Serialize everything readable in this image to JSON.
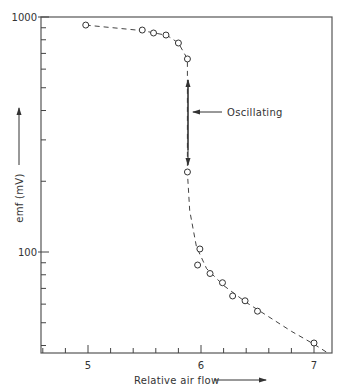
{
  "chart_data": {
    "type": "scatter",
    "title": "",
    "xlabel": "Relative air flow",
    "ylabel": "emf (mV)",
    "x_scale": "linear",
    "y_scale": "log",
    "xlim": [
      4.58,
      7.13
    ],
    "ylim": [
      35,
      1000
    ],
    "x_ticks": [
      5,
      6,
      7
    ],
    "x_tick_labels": [
      "5",
      "6",
      "7"
    ],
    "x_minor_step": 0.2,
    "y_ticks": [
      100,
      1000
    ],
    "y_tick_labels": [
      "100",
      "1000"
    ],
    "y_minor_ticks": [
      40,
      50,
      60,
      70,
      80,
      90,
      200,
      300,
      400,
      500,
      600,
      700,
      800,
      900
    ],
    "grid": false,
    "legend": null,
    "series": [
      {
        "name": "emf vs relative air flow",
        "marker": "open-circle",
        "line": "dashed",
        "points": [
          {
            "x": 4.98,
            "y": 924
          },
          {
            "x": 5.48,
            "y": 880
          },
          {
            "x": 5.58,
            "y": 855
          },
          {
            "x": 5.69,
            "y": 838
          },
          {
            "x": 5.8,
            "y": 775
          },
          {
            "x": 5.88,
            "y": 663
          },
          {
            "x": 5.88,
            "y": 219
          },
          {
            "x": 5.99,
            "y": 103
          },
          {
            "x": 5.97,
            "y": 88
          },
          {
            "x": 6.08,
            "y": 81
          },
          {
            "x": 6.19,
            "y": 74
          },
          {
            "x": 6.28,
            "y": 65
          },
          {
            "x": 6.39,
            "y": 62
          },
          {
            "x": 6.5,
            "y": 56
          },
          {
            "x": 7.0,
            "y": 41
          }
        ]
      }
    ],
    "annotations": [
      {
        "text": "Oscillating",
        "type": "double-arrow",
        "x": 5.88,
        "y_from": 663,
        "y_to": 219,
        "label_arrow_points_to": "double-arrow"
      }
    ]
  },
  "labels": {
    "x_axis_title": "Relative air flow",
    "y_axis_title": "emf (mV)",
    "oscillating": "Oscillating",
    "x_tick_5": "5",
    "x_tick_6": "6",
    "x_tick_7": "7",
    "y_tick_100": "100",
    "y_tick_1000": "1000"
  },
  "colors": {
    "ink": "#333333",
    "background": "#ffffff"
  }
}
